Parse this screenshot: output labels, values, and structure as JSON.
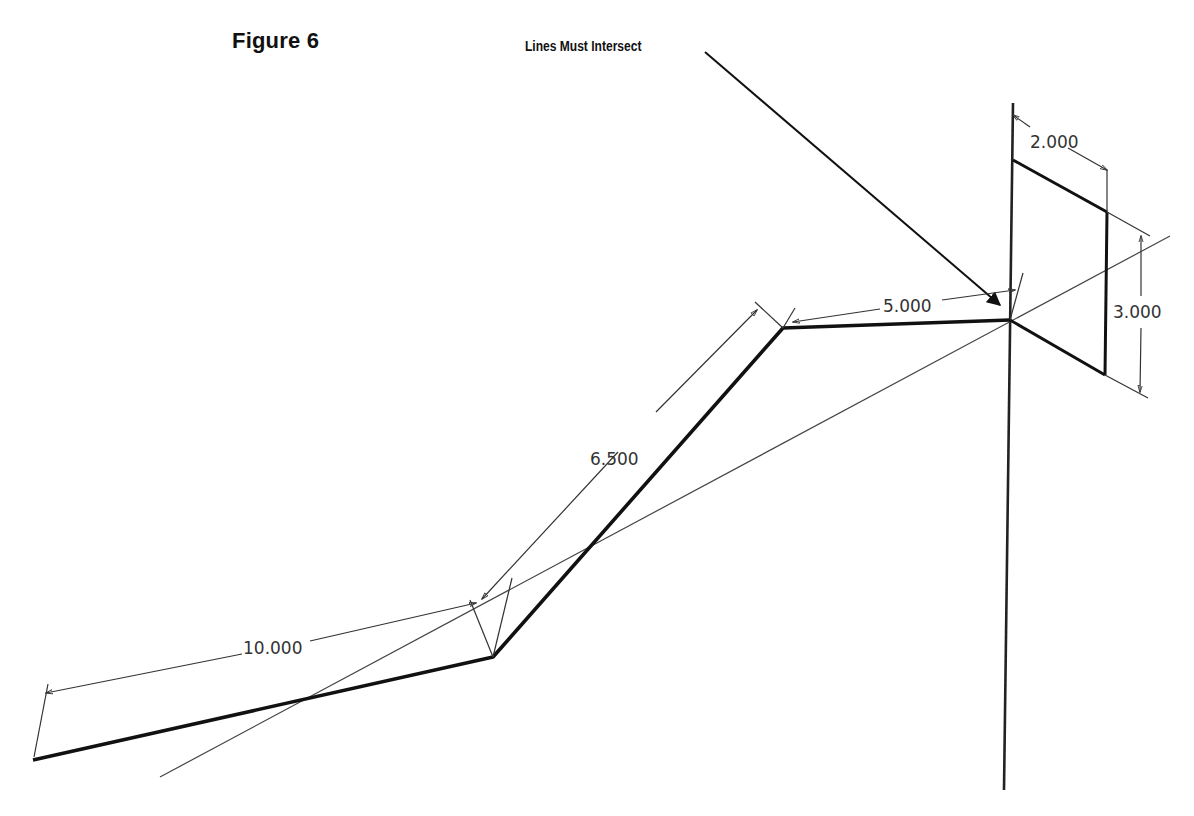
{
  "figure": {
    "title": "Figure 6",
    "callout": "Lines Must Intersect"
  },
  "dimensions": {
    "seg1_length": "10.000",
    "seg2_length": "6.500",
    "seg3_length": "5.000",
    "rect_width": "2.000",
    "rect_height": "3.000"
  },
  "colors": {
    "line": "#111111",
    "thin_line": "#333333",
    "text": "#111111",
    "background": "#ffffff"
  }
}
